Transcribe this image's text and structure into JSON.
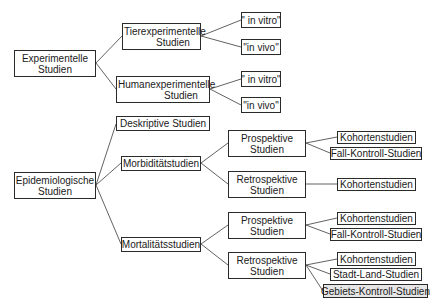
{
  "diagram": {
    "type": "tree",
    "nodes": {
      "experimentelle": {
        "line1": "Experimentelle",
        "line2": "Studien"
      },
      "tierexp": {
        "line1": "Tierexperimentelle",
        "line2": "Studien"
      },
      "tier_vitro": {
        "label": "\" in vitro\""
      },
      "tier_vivo": {
        "label": "\"in vivo\""
      },
      "humanexp": {
        "line1": "Humanexperimentelle",
        "line2": "Studien"
      },
      "human_vitro": {
        "label": "\" in vitro\""
      },
      "human_vivo": {
        "label": "\"in vivo\""
      },
      "deskriptive": {
        "label": "Deskriptive Studien"
      },
      "epidemiologische": {
        "line1": "Epidemiologische",
        "line2": "Studien"
      },
      "morbiditaet": {
        "label": "Morbiditätstudien"
      },
      "morb_prosp": {
        "line1": "Prospektive",
        "line2": "Studien"
      },
      "morb_prosp_kohorten": {
        "label": "Kohortenstudien"
      },
      "morb_prosp_fallkontroll": {
        "label": "Fall-Kontroll-Studien"
      },
      "morb_retro": {
        "line1": "Retrospektive",
        "line2": "Studien"
      },
      "morb_retro_kohorten": {
        "label": "Kohortenstudien"
      },
      "mortalitaet": {
        "label": "Mortalitätsstudien"
      },
      "mort_prosp": {
        "line1": "Prospektive",
        "line2": "Studien"
      },
      "mort_prosp_kohorten": {
        "label": "Kohortenstudien"
      },
      "mort_prosp_fallkontroll": {
        "label": "Fall-Kontroll-Studien"
      },
      "mort_retro": {
        "line1": "Retrospektive",
        "line2": "Studien"
      },
      "mort_retro_kohorten": {
        "label": "Kohortenstudien"
      },
      "mort_retro_stadtland": {
        "label": "Stadt-Land-Studien"
      },
      "mort_retro_gebiets": {
        "label": "Gebiets-Kontroll-Studien",
        "highlighted": true
      }
    },
    "edges": [
      [
        "experimentelle",
        "tierexp"
      ],
      [
        "experimentelle",
        "humanexp"
      ],
      [
        "tierexp",
        "tier_vitro"
      ],
      [
        "tierexp",
        "tier_vivo"
      ],
      [
        "humanexp",
        "human_vitro"
      ],
      [
        "humanexp",
        "human_vivo"
      ],
      [
        "epidemiologische",
        "deskriptive"
      ],
      [
        "epidemiologische",
        "morbiditaet"
      ],
      [
        "epidemiologische",
        "mortalitaet"
      ],
      [
        "morbiditaet",
        "morb_prosp"
      ],
      [
        "morbiditaet",
        "morb_retro"
      ],
      [
        "morb_prosp",
        "morb_prosp_kohorten"
      ],
      [
        "morb_prosp",
        "morb_prosp_fallkontroll"
      ],
      [
        "morb_retro",
        "morb_retro_kohorten"
      ],
      [
        "mortalitaet",
        "mort_prosp"
      ],
      [
        "mortalitaet",
        "mort_retro"
      ],
      [
        "mort_prosp",
        "mort_prosp_kohorten"
      ],
      [
        "mort_prosp",
        "mort_prosp_fallkontroll"
      ],
      [
        "mort_retro",
        "mort_retro_kohorten"
      ],
      [
        "mort_retro",
        "mort_retro_stadtland"
      ],
      [
        "mort_retro",
        "mort_retro_gebiets"
      ]
    ],
    "colors": {
      "border": "#2a2a2a",
      "line": "#3a3a3a",
      "highlight_fill": "#e6e6e6"
    }
  }
}
